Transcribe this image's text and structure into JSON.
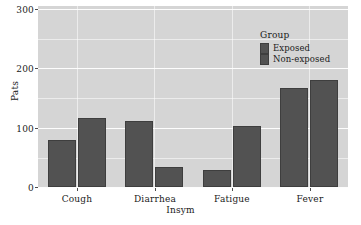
{
  "chart_data": {
    "type": "bar",
    "title": "",
    "xlabel": "Insym",
    "ylabel": "Pats",
    "categories": [
      "Cough",
      "Diarrhea",
      "Fatigue",
      "Fever"
    ],
    "series": [
      {
        "name": "Exposed",
        "values": [
          79,
          111,
          29,
          167
        ],
        "color": "#525252"
      },
      {
        "name": "Non-exposed",
        "values": [
          116,
          34,
          103,
          180
        ],
        "color": "#525252"
      }
    ],
    "ylim": [
      0,
      300
    ],
    "yticks": [
      0,
      100,
      200,
      300
    ],
    "ytick_labels": [
      "0",
      "100",
      "200",
      "300"
    ],
    "grid": true,
    "legend_position": "top-right-inside",
    "legend_title": "Group",
    "panel_background": "#d5d5d5",
    "gridline_color": "#ffffff",
    "bar_color": "#525252"
  },
  "legend": {
    "title": "Group",
    "items": [
      {
        "label": "Exposed"
      },
      {
        "label": "Non-exposed"
      }
    ]
  },
  "axes": {
    "y_title": "Pats",
    "x_title": "Insym",
    "y_tick_labels": [
      "300",
      "200",
      "100",
      "0"
    ],
    "x_tick_labels": [
      "Cough",
      "Diarrhea",
      "Fatigue",
      "Fever"
    ]
  }
}
